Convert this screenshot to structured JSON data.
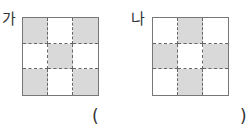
{
  "figures": [
    {
      "label": "가",
      "rows": 3,
      "cols": 3,
      "shaded": [
        true,
        false,
        true,
        false,
        true,
        false,
        true,
        false,
        true
      ]
    },
    {
      "label": "나",
      "rows": 3,
      "cols": 3,
      "shaded": [
        false,
        true,
        false,
        true,
        false,
        true,
        false,
        true,
        false
      ]
    }
  ],
  "answer": {
    "open": "(",
    "close": ")",
    "value": ""
  },
  "colors": {
    "shaded": "#d9d9d9",
    "unshaded": "#ffffff",
    "border": "#777777"
  }
}
